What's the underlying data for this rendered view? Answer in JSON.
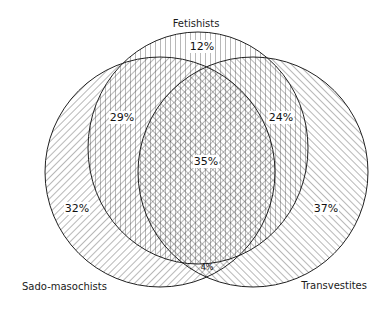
{
  "diagram": {
    "type": "venn",
    "sets": [
      {
        "name": "Fetishists",
        "label_pos": "top"
      },
      {
        "name": "Sado-masochists",
        "label_pos": "bottom-left"
      },
      {
        "name": "Transvestites",
        "label_pos": "bottom-right"
      }
    ],
    "regions": [
      {
        "id": "fetishists_only",
        "sets": [
          "Fetishists"
        ],
        "value": "12%"
      },
      {
        "id": "fetishists_sado",
        "sets": [
          "Fetishists",
          "Sado-masochists"
        ],
        "value": "29%"
      },
      {
        "id": "fetishists_trans",
        "sets": [
          "Fetishists",
          "Transvestites"
        ],
        "value": "24%"
      },
      {
        "id": "all_three",
        "sets": [
          "Fetishists",
          "Sado-masochists",
          "Transvestites"
        ],
        "value": "35%"
      },
      {
        "id": "sado_only",
        "sets": [
          "Sado-masochists"
        ],
        "value": "32%"
      },
      {
        "id": "trans_only",
        "sets": [
          "Transvestites"
        ],
        "value": "37%"
      },
      {
        "id": "sado_trans",
        "sets": [
          "Sado-masochists",
          "Transvestites"
        ],
        "value": "4%"
      }
    ]
  },
  "labels": {
    "fetishists": "Fetishists",
    "sado": "Sado-masochists",
    "trans": "Transvestites"
  },
  "values": {
    "fetishists_only": "12%",
    "fetishists_sado": "29%",
    "fetishists_trans": "24%",
    "all_three": "35%",
    "sado_only": "32%",
    "trans_only": "37%",
    "sado_trans": "4%"
  }
}
